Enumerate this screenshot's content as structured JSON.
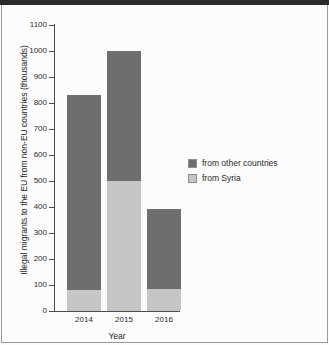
{
  "chart_data": {
    "type": "bar",
    "subtype": "stacked-bar",
    "title": "",
    "xlabel": "Year",
    "ylabel": "Illegal migrants to the EU from non-EU countries (thousands)",
    "categories": [
      "2014",
      "2015",
      "2016"
    ],
    "series": [
      {
        "name": "from Syria",
        "color": "#c6c6c6",
        "values": [
          79,
          500,
          85
        ]
      },
      {
        "name": "from other countries",
        "color": "#6e6e6e",
        "values": [
          751,
          500,
          307
        ]
      }
    ],
    "totals": [
      830,
      1000,
      392
    ],
    "stack_order": [
      "from Syria",
      "from other countries"
    ],
    "ylim": [
      0,
      1100
    ],
    "yticks": [
      0,
      100,
      200,
      300,
      400,
      500,
      600,
      700,
      800,
      900,
      1000,
      1100
    ],
    "ytick_labels": [
      "0",
      "100",
      "200",
      "300",
      "400",
      "500",
      "600",
      "700",
      "800",
      "900",
      "1000",
      "1100"
    ],
    "grid": false,
    "legend_position": "right",
    "legend_entries": [
      "from other countries",
      "from Syria"
    ]
  },
  "legend": {
    "entries": [
      {
        "label": "from other countries",
        "color": "#6e6e6e"
      },
      {
        "label": "from Syria",
        "color": "#c6c6c6"
      }
    ]
  },
  "axes": {
    "y_title": "Illegal migrants to the EU from non-EU countries (thousands)",
    "x_title": "Year"
  },
  "colors": {
    "other_countries": "#6e6e6e",
    "syria": "#c6c6c6",
    "axis": "#4c4c4c",
    "background": "#fcfcfc"
  }
}
